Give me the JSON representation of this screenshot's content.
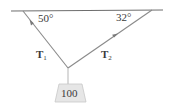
{
  "diagram": {
    "ceiling": {
      "x1": 11,
      "y1": 11,
      "x2": 163,
      "y2": 10,
      "color": "#6e6e6e"
    },
    "junction": {
      "x": 68,
      "y": 68
    },
    "rope_left": {
      "x1": 23,
      "y1": 11,
      "x2": 68,
      "y2": 68,
      "color": "#8a8a8a"
    },
    "rope_right": {
      "x1": 152,
      "y1": 10,
      "x2": 68,
      "y2": 68,
      "color": "#8a8a8a"
    },
    "hanger": {
      "x1": 68,
      "y1": 68,
      "x2": 68,
      "y2": 84,
      "color": "#b5b5b5"
    },
    "angles": {
      "left": "50°",
      "right": "32°"
    },
    "tensions": {
      "t1_main": "T",
      "t1_sub": "1",
      "t2_main": "T",
      "t2_sub": "2"
    },
    "weight": {
      "label": "100",
      "fill": "#e6e6e6",
      "stroke": "#c8c8c8"
    }
  }
}
